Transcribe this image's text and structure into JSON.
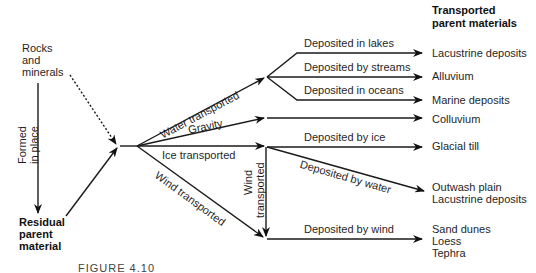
{
  "header": {
    "title_line1": "Transported",
    "title_line2": "parent materials"
  },
  "left": {
    "source_line1": "Rocks",
    "source_line2": "and",
    "source_line3": "minerals",
    "formed_line1": "Formed",
    "formed_line2": "in place",
    "residual_line1": "Residual",
    "residual_line2": "parent",
    "residual_line3": "material"
  },
  "transport": {
    "water": "Water transported",
    "gravity": "Gravity",
    "ice": "Ice transported",
    "wind": "Wind transported",
    "wind_vertical_line1": "Wind",
    "wind_vertical_line2": "transported"
  },
  "deposition": {
    "lakes": "Deposited in lakes",
    "streams": "Deposited by streams",
    "oceans": "Deposited in oceans",
    "ice": "Deposited by ice",
    "water": "Deposited by water",
    "wind": "Deposited by wind"
  },
  "materials": {
    "lacustrine": "Lacustrine deposits",
    "alluvium": "Alluvium",
    "marine": "Marine deposits",
    "colluvium": "Colluvium",
    "glacial_till": "Glacial till",
    "outwash_line1": "Outwash plain",
    "outwash_line2": "Lacustrine deposits",
    "wind_line1": "Sand dunes",
    "wind_line2": "Loess",
    "wind_line3": "Tephra"
  },
  "caption": "FIGURE 4.10"
}
